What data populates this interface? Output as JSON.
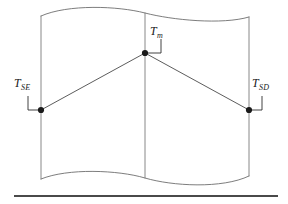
{
  "figure": {
    "background_color": "#ffffff",
    "width": 288,
    "height": 204,
    "line_color": "#6e6e6e",
    "profile_color": "#4a4a4a",
    "marker_color": "#1a1a1a",
    "rule_color": "#4a4a4a"
  },
  "labels": [
    {
      "id": "t-se",
      "name": "label-t-se",
      "base": "T",
      "subscript": "SE",
      "full_text": "TSE",
      "x": 14,
      "y": 77
    },
    {
      "id": "t-m",
      "name": "label-t-m",
      "base": "T",
      "subscript": "m",
      "full_text": "Tm",
      "x": 150,
      "y": 25
    },
    {
      "id": "t-sd",
      "name": "label-t-sd",
      "base": "T",
      "subscript": "SD",
      "full_text": "TSD",
      "x": 252,
      "y": 77
    }
  ],
  "nodes": [
    {
      "id": "t-se",
      "x": 41,
      "y": 110,
      "radius": 3.1
    },
    {
      "id": "t-m",
      "x": 145,
      "y": 53,
      "radius": 3.1
    },
    {
      "id": "t-sd",
      "x": 249,
      "y": 110,
      "radius": 3.1
    }
  ],
  "geometry": {
    "vertical_lines": [
      {
        "name": "left-boundary",
        "x": 41,
        "y_top": 16,
        "y_bottom": 179
      },
      {
        "name": "middle-boundary",
        "x": 145,
        "y_top": 13,
        "y_bottom": 178
      },
      {
        "name": "right-boundary",
        "x": 249,
        "y_top": 17,
        "y_bottom": 176
      }
    ],
    "top_edge_path": "M 41 16 C 68 4, 118 6, 145 13 C 172 20, 222 25, 249 17",
    "bottom_edge_path": "M 41 179 C 68 168, 118 170, 145 178 C 172 186, 222 189, 249 176",
    "profile_path": "M 41 110 L 145 53 L 249 110",
    "leaders": [
      {
        "id": "t-se",
        "path": "M 28 96 L 28 110 L 41 110"
      },
      {
        "id": "t-m",
        "path": "M 161 39 L 161 53 L 145 53"
      },
      {
        "id": "t-sd",
        "path": "M 262 96 L 262 110 L 249 110"
      }
    ],
    "baseline_rule": {
      "x1": 14,
      "x2": 278,
      "y": 196
    }
  }
}
